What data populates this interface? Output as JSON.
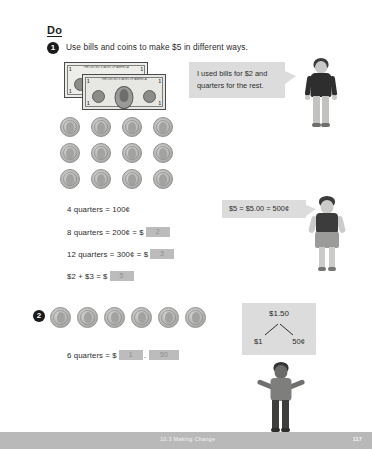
{
  "header": {
    "section_label": "Do"
  },
  "questions": [
    {
      "number": "1",
      "prompt": "Use bills and coins to make $5 in different ways.",
      "bills_count": 2,
      "bill_label_top": "THE UNITED STATES OF AMERICA",
      "bill_denomination": "1",
      "coins_count": 12,
      "speech": "I used bills for $2 and quarters for the rest.",
      "callout": "$5 = $5.00 = 500¢",
      "equations": [
        {
          "text": "4 quarters = 100¢",
          "answer": "",
          "has_box": false
        },
        {
          "text": "8 quarters = 200¢ = $",
          "answer": "2",
          "has_box": true
        },
        {
          "text": "12 quarters = 300¢ = $",
          "answer": "3",
          "has_box": true
        },
        {
          "text": "$2 + $3 = $",
          "answer": "5",
          "has_box": true
        }
      ]
    },
    {
      "number": "2",
      "coins_count": 6,
      "equation_text": "6 quarters = $",
      "answer_dollars": "1",
      "answer_cents": "50",
      "decimal_point": ".",
      "number_bond": {
        "total": "$1.50",
        "part_left": "$1",
        "part_right": "50¢"
      }
    }
  ],
  "footer": {
    "lesson": "10.3 Making Change",
    "page_number": "117"
  },
  "colors": {
    "answer_box": "#bcbcbc",
    "bubble": "#dcdcdc",
    "footer_bar": "#b9b9b9"
  }
}
